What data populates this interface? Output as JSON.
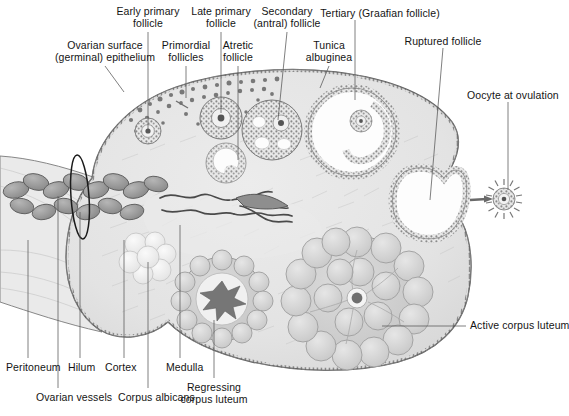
{
  "figure": {
    "background": "#ffffff",
    "ink": "#141414",
    "leader_color": "#555555",
    "stroma_fill": "#e3e3e3",
    "stroma_edge": "#6e6e6e",
    "follicle_wall": "#8d8d8d",
    "antrum_fill": "#fdfdfd",
    "luteum_fill": "#d2d2d2",
    "albicans_fill": "#efefef",
    "vessel_fill": "#9a9a9a"
  },
  "labels": {
    "top": [
      {
        "key": "ovarian-surface-epithelium",
        "lines": [
          "Ovarian surface",
          "(germinal) epithelium"
        ],
        "x": 105,
        "y": 40,
        "align": "c",
        "leader": [
          [
            105,
            66
          ],
          [
            124,
            92
          ]
        ]
      },
      {
        "key": "early-primary-follicle",
        "lines": [
          "Early primary",
          "follicle"
        ],
        "x": 148,
        "y": 6,
        "align": "c",
        "leader": [
          [
            148,
            32
          ],
          [
            148,
            130
          ]
        ]
      },
      {
        "key": "primordial-follicles",
        "lines": [
          "Primordial",
          "follicles"
        ],
        "x": 186,
        "y": 40,
        "align": "c",
        "leader": [
          [
            186,
            66
          ],
          [
            186,
            98
          ]
        ]
      },
      {
        "key": "late-primary-follicle",
        "lines": [
          "Late primary",
          "follicle"
        ],
        "x": 221,
        "y": 6,
        "align": "c",
        "leader": [
          [
            221,
            32
          ],
          [
            221,
            113
          ]
        ]
      },
      {
        "key": "atretic-follicle",
        "lines": [
          "Atretic",
          "follicle"
        ],
        "x": 238,
        "y": 40,
        "align": "c",
        "leader": [
          [
            238,
            66
          ],
          [
            238,
            160
          ]
        ]
      },
      {
        "key": "secondary-antral-follicle",
        "lines": [
          "Secondary",
          "(antral) follicle"
        ],
        "x": 287,
        "y": 6,
        "align": "c",
        "leader": [
          [
            287,
            32
          ],
          [
            278,
            120
          ]
        ]
      },
      {
        "key": "tunica-albuginea",
        "lines": [
          "Tunica",
          "albuginea"
        ],
        "x": 329,
        "y": 40,
        "align": "c",
        "leader": [
          [
            329,
            66
          ],
          [
            320,
            88
          ]
        ]
      },
      {
        "key": "tertiary-graafian-follicle",
        "lines": [
          "Tertiary (Graafian follicle)"
        ],
        "x": 380,
        "y": 8,
        "align": "c",
        "leader": [
          [
            355,
            20
          ],
          [
            355,
            100
          ]
        ]
      },
      {
        "key": "ruptured-follicle",
        "lines": [
          "Ruptured follicle"
        ],
        "x": 443,
        "y": 36,
        "align": "c",
        "leader": [
          [
            443,
            48
          ],
          [
            430,
            200
          ]
        ]
      },
      {
        "key": "oocyte-at-ovulation",
        "lines": [
          "Oocyte at ovulation"
        ],
        "x": 467,
        "y": 90,
        "align": "l",
        "leader": [
          [
            508,
            102
          ],
          [
            508,
            190
          ]
        ]
      }
    ],
    "right": [
      {
        "key": "active-corpus-luteum",
        "lines": [
          "Active corpus luteum"
        ],
        "x": 470,
        "y": 320,
        "align": "l",
        "leader": [
          [
            466,
            326
          ],
          [
            382,
            326
          ]
        ]
      }
    ],
    "bottom": [
      {
        "key": "peritoneum",
        "lines": [
          "Peritoneum"
        ],
        "x": 6,
        "y": 362,
        "align": "l",
        "leader": [
          [
            28,
            358
          ],
          [
            28,
            240
          ]
        ]
      },
      {
        "key": "hilum",
        "lines": [
          "Hilum"
        ],
        "x": 68,
        "y": 362,
        "align": "l",
        "leader": [
          [
            80,
            358
          ],
          [
            80,
            212
          ]
        ]
      },
      {
        "key": "cortex",
        "lines": [
          "Cortex"
        ],
        "x": 105,
        "y": 362,
        "align": "l",
        "leader": [
          [
            124,
            358
          ],
          [
            124,
            240
          ]
        ]
      },
      {
        "key": "medulla",
        "lines": [
          "Medulla"
        ],
        "x": 166,
        "y": 362,
        "align": "l",
        "leader": [
          [
            180,
            358
          ],
          [
            180,
            225
          ]
        ]
      },
      {
        "key": "ovarian-vessels",
        "lines": [
          "Ovarian vessels"
        ],
        "x": 36,
        "y": 392,
        "align": "l",
        "leader": [
          [
            58,
            388
          ],
          [
            58,
            196
          ]
        ]
      },
      {
        "key": "corpus-albicans",
        "lines": [
          "Corpus albicans"
        ],
        "x": 118,
        "y": 392,
        "align": "l",
        "leader": [
          [
            148,
            388
          ],
          [
            148,
            262
          ]
        ]
      },
      {
        "key": "regressing-corpus-luteum",
        "lines": [
          "Regressing",
          "corpus luteum"
        ],
        "x": 214,
        "y": 382,
        "align": "c",
        "leader": [
          [
            214,
            378
          ],
          [
            214,
            320
          ]
        ]
      }
    ]
  },
  "structures": {
    "stroma": "ovarian-stroma",
    "medulla": "medulla-region",
    "cortex": "cortex-region",
    "hilum_vessels": "coiled-ovarian-vessels",
    "mesovarium": "peritoneal-mesovarium-fold",
    "hilum_marker": "hilum-ellipse-marker",
    "primordial_count": 34,
    "follicles": [
      {
        "name": "early-primary-follicle",
        "cx": 148,
        "cy": 131,
        "r": 13
      },
      {
        "name": "late-primary-follicle",
        "cx": 221,
        "cy": 118,
        "r": 21
      },
      {
        "name": "atretic-follicle",
        "cx": 226,
        "cy": 163,
        "r": 20
      },
      {
        "name": "secondary-antral-follicle",
        "cx": 272,
        "cy": 130,
        "r": 30
      },
      {
        "name": "tertiary-graafian-follicle",
        "cx": 352,
        "cy": 132,
        "r": 44
      },
      {
        "name": "ruptured-follicle",
        "cx": 424,
        "cy": 202,
        "r": 38
      }
    ],
    "corpora": [
      {
        "name": "regressing-corpus-luteum",
        "cx": 222,
        "cy": 299,
        "r": 42,
        "lobes": 17
      },
      {
        "name": "active-corpus-luteum",
        "cx": 357,
        "cy": 298,
        "r": 62,
        "lobes": 20
      },
      {
        "name": "corpus-albicans",
        "cx": 147,
        "cy": 258,
        "r": 25
      }
    ],
    "oocyte": {
      "name": "ovulated-oocyte",
      "cx": 504,
      "cy": 199,
      "r": 11,
      "spikes": 22
    },
    "ovulation_arrow": {
      "from": [
        470,
        200
      ],
      "to": [
        489,
        199
      ]
    }
  }
}
